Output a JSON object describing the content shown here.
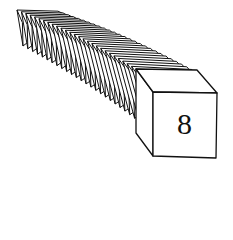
{
  "diagram": {
    "cube_count_visible": 28,
    "front_cube_label": "8",
    "stroke_color": "#111111",
    "fill_color": "#ffffff"
  }
}
